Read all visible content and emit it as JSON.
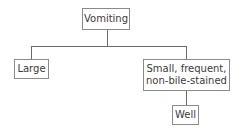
{
  "diagram": {
    "type": "tree",
    "nodes": {
      "root": {
        "label": "Vomiting"
      },
      "left": {
        "label": "Large"
      },
      "right": {
        "label_line1": "Small, frequent,",
        "label_line2": "non-bile-stained"
      },
      "right_child": {
        "label": "Well"
      }
    },
    "edges": [
      [
        "Vomiting",
        "Large"
      ],
      [
        "Vomiting",
        "Small, frequent, non-bile-stained"
      ],
      [
        "Small, frequent, non-bile-stained",
        "Well"
      ]
    ]
  }
}
